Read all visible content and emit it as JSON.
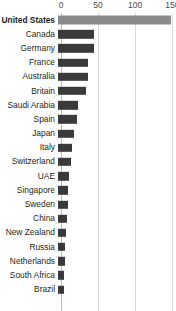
{
  "chart_data": {
    "type": "bar",
    "orientation": "horizontal",
    "title": "",
    "subtitle": "",
    "xlabel": "",
    "ylabel": "",
    "xlim": [
      0,
      155
    ],
    "ticks": [
      0,
      50,
      100,
      150
    ],
    "tick_labels": [
      "0",
      "50",
      "100",
      "150"
    ],
    "grid": true,
    "grid_axis": "x",
    "legend": "none",
    "highlight_category": "United States",
    "colors": {
      "bar": "#3a3a3a",
      "highlight_bar": "#8a8a8a",
      "gridline": "#d9d9d9",
      "axis": "#bdbdbd",
      "text": "#231f20",
      "tick_text": "#4a4a4a",
      "background": "#ffffff"
    },
    "categories": [
      "United States",
      "Canada",
      "Germany",
      "France",
      "Australia",
      "Britain",
      "Saudi Arabia",
      "Spain",
      "Japan",
      "Italy",
      "Switzerland",
      "UAE",
      "Singapore",
      "Sweden",
      "China",
      "New Zealand",
      "Russia",
      "Netherlands",
      "South Africa",
      "Brazil"
    ],
    "values": [
      152,
      49,
      48,
      40,
      40,
      38,
      27,
      26,
      22,
      19,
      17,
      15,
      14,
      13,
      12,
      11,
      10,
      9,
      8,
      8
    ]
  }
}
